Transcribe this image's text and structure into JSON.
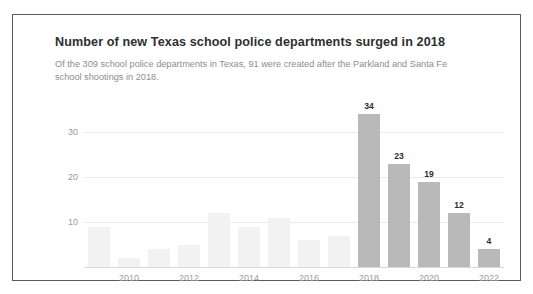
{
  "card": {
    "title": "Number of new Texas school police departments surged in 2018",
    "subtitle": "Of the 309 school police departments in Texas, 91 were created after the Parkland and Santa Fe school shootings in 2018."
  },
  "chart_data": {
    "type": "bar",
    "title": "Number of new Texas school police departments surged in 2018",
    "subtitle": "Of the 309 school police departments in Texas, 91 were created after the Parkland and Santa Fe school shootings in 2018.",
    "xlabel": "",
    "ylabel": "",
    "ylim": [
      0,
      36
    ],
    "ytick_values": [
      10,
      20,
      30
    ],
    "ytick_labels": [
      "10",
      "20",
      "30"
    ],
    "grid": true,
    "legend": "none",
    "categories": [
      "2009",
      "2010",
      "2011",
      "2012",
      "2013",
      "2014",
      "2015",
      "2016",
      "2017",
      "2018",
      "2019",
      "2020",
      "2021",
      "2022"
    ],
    "xtick_labels": [
      "",
      "2010",
      "",
      "2012",
      "",
      "2014",
      "",
      "2016",
      "",
      "2018",
      "",
      "2020",
      "",
      "2022"
    ],
    "values": [
      9,
      2,
      4,
      5,
      12,
      9,
      11,
      6,
      7,
      34,
      23,
      19,
      12,
      4
    ],
    "bar_value_labels": [
      "",
      "",
      "",
      "",
      "",
      "",
      "",
      "",
      "",
      "34",
      "23",
      "19",
      "12",
      "4"
    ],
    "highlighted_categories": [
      "2018",
      "2019",
      "2020",
      "2021",
      "2022"
    ],
    "colors": {
      "bar_muted": "#f2f2f2",
      "bar_accent": "#b9b9b9",
      "gridline": "#ebebeb",
      "axis": "#d8d8d8",
      "title_text": "#2f2f2f",
      "subtitle_text": "#8d8d8d",
      "tick_text": "#9a9a9a",
      "card_border": "#5a5a5a",
      "background": "#ffffff"
    }
  }
}
